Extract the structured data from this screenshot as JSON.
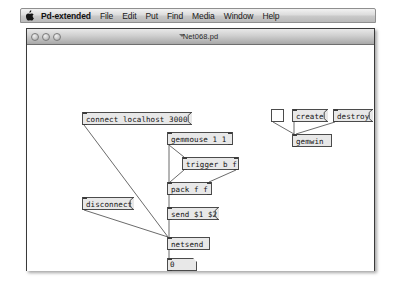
{
  "menubar": {
    "apple_icon": "apple-icon",
    "app_name": "Pd-extended",
    "items": [
      {
        "label": "File"
      },
      {
        "label": "Edit"
      },
      {
        "label": "Put"
      },
      {
        "label": "Find"
      },
      {
        "label": "Media"
      },
      {
        "label": "Window"
      },
      {
        "label": "Help"
      }
    ]
  },
  "window": {
    "title": "Net068.pd",
    "controls": {
      "close_label": "",
      "minimize_label": "",
      "zoom_label": ""
    }
  },
  "canvas": {
    "objects": [
      {
        "id": "connect",
        "kind": "message",
        "text": "connect localhost 3000",
        "x": 55,
        "y": 67,
        "w": 110,
        "h": 13
      },
      {
        "id": "disconnect",
        "kind": "message",
        "text": "disconnect",
        "x": 55,
        "y": 152,
        "w": 52,
        "h": 13
      },
      {
        "id": "gemmouse",
        "kind": "object",
        "text": "gemmouse 1 1",
        "x": 140,
        "y": 87,
        "w": 66,
        "h": 13
      },
      {
        "id": "trigger",
        "kind": "object",
        "text": "trigger b f",
        "x": 155,
        "y": 112,
        "w": 57,
        "h": 13
      },
      {
        "id": "pack",
        "kind": "object",
        "text": "pack f f",
        "x": 140,
        "y": 137,
        "w": 45,
        "h": 13
      },
      {
        "id": "sendmsg",
        "kind": "message",
        "text": "send $1 $2",
        "x": 140,
        "y": 162,
        "w": 52,
        "h": 13
      },
      {
        "id": "netsend",
        "kind": "object",
        "text": "netsend",
        "x": 140,
        "y": 192,
        "w": 43,
        "h": 13
      },
      {
        "id": "numberbox",
        "kind": "number",
        "text": "0",
        "x": 140,
        "y": 213,
        "w": 30,
        "h": 13
      },
      {
        "id": "toggle",
        "kind": "toggle",
        "text": "",
        "x": 244,
        "y": 64,
        "w": 13,
        "h": 13
      },
      {
        "id": "create",
        "kind": "message",
        "text": "create",
        "x": 265,
        "y": 64,
        "w": 36,
        "h": 13
      },
      {
        "id": "destroy",
        "kind": "message",
        "text": "destroy",
        "x": 306,
        "y": 64,
        "w": 40,
        "h": 13
      },
      {
        "id": "gemwin",
        "kind": "object",
        "text": "gemwin",
        "x": 265,
        "y": 89,
        "w": 40,
        "h": 13
      }
    ],
    "wires": [
      {
        "from": "connect",
        "x1": 57,
        "y1": 80,
        "x2": 141,
        "y2": 192
      },
      {
        "from": "disconnect",
        "x1": 57,
        "y1": 165,
        "x2": 141,
        "y2": 192
      },
      {
        "from": "gemmouse",
        "x1": 142,
        "y1": 100,
        "x2": 142,
        "y2": 137
      },
      {
        "from": "gemmouse2",
        "x1": 142,
        "y1": 100,
        "x2": 157,
        "y2": 112
      },
      {
        "from": "trigger_l",
        "x1": 157,
        "y1": 125,
        "x2": 143,
        "y2": 137
      },
      {
        "from": "trigger_r",
        "x1": 209,
        "y1": 125,
        "x2": 182,
        "y2": 137
      },
      {
        "from": "pack",
        "x1": 142,
        "y1": 150,
        "x2": 142,
        "y2": 162
      },
      {
        "from": "sendmsg",
        "x1": 142,
        "y1": 175,
        "x2": 142,
        "y2": 192
      },
      {
        "from": "netsend",
        "x1": 142,
        "y1": 205,
        "x2": 142,
        "y2": 213
      },
      {
        "from": "toggle",
        "x1": 246,
        "y1": 77,
        "x2": 267,
        "y2": 89
      },
      {
        "from": "create",
        "x1": 267,
        "y1": 77,
        "x2": 267,
        "y2": 89
      },
      {
        "from": "destroy",
        "x1": 308,
        "y1": 77,
        "x2": 269,
        "y2": 89
      }
    ]
  },
  "colors": {
    "box_fill": "#e8e8e8",
    "box_border": "#4b4b4b",
    "canvas_bg": "#ffffff",
    "wire": "#6b6b6b"
  }
}
